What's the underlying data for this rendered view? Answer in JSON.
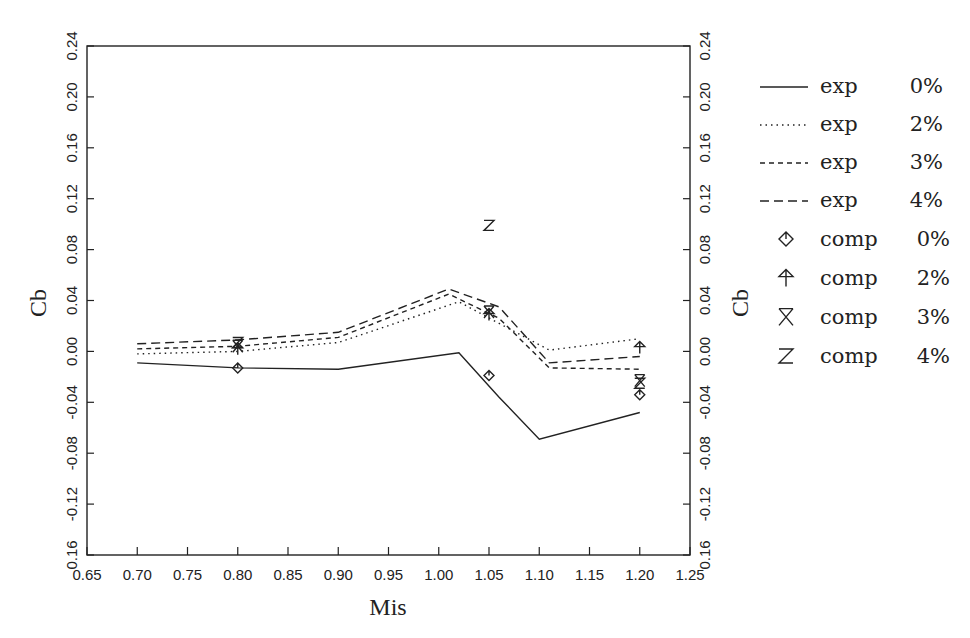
{
  "chart_data": {
    "type": "line",
    "title": "",
    "xlabel": "Mis",
    "ylabel": "Cb",
    "ylabel_right": "Cb",
    "xlim": [
      0.65,
      1.25
    ],
    "ylim": [
      -0.16,
      0.24
    ],
    "grid": false,
    "legend_position": "right-outside",
    "x_ticks": [
      "0.65",
      "0.70",
      "0.75",
      "0.80",
      "0.85",
      "0.90",
      "0.95",
      "1.00",
      "1.05",
      "1.10",
      "1.15",
      "1.20",
      "1.25"
    ],
    "y_ticks": [
      "-0.16",
      "-0.12",
      "-0.08",
      "-0.04",
      "0.00",
      "0.04",
      "0.08",
      "0.12",
      "0.16",
      "0.20",
      "0.24"
    ],
    "y_tick_labels_left": [
      "0.16",
      "-0.12",
      "-0.08",
      "-0.04",
      "0.00",
      "0.04",
      "0.08",
      "0.12",
      "0.16",
      "0.20",
      "0.24"
    ],
    "series": [
      {
        "name": "exp 0%",
        "kind": "line",
        "style": "solid",
        "x": [
          0.7,
          0.8,
          0.9,
          1.02,
          1.06,
          1.1,
          1.2
        ],
        "y": [
          -0.009,
          -0.013,
          -0.014,
          -0.001,
          -0.036,
          -0.069,
          -0.048
        ]
      },
      {
        "name": "exp 2%",
        "kind": "line",
        "style": "dotted",
        "x": [
          0.7,
          0.8,
          0.9,
          1.02,
          1.06,
          1.11,
          1.2
        ],
        "y": [
          -0.002,
          0.0,
          0.007,
          0.039,
          0.022,
          0.001,
          0.01
        ]
      },
      {
        "name": "exp 3%",
        "kind": "line",
        "style": "short-dash",
        "x": [
          0.7,
          0.8,
          0.9,
          1.01,
          1.06,
          1.11,
          1.2
        ],
        "y": [
          0.002,
          0.004,
          0.011,
          0.045,
          0.026,
          -0.013,
          -0.014
        ]
      },
      {
        "name": "exp 4%",
        "kind": "line",
        "style": "long-dash",
        "x": [
          0.7,
          0.8,
          0.9,
          1.01,
          1.06,
          1.11,
          1.2
        ],
        "y": [
          0.006,
          0.009,
          0.015,
          0.049,
          0.035,
          -0.009,
          -0.004
        ]
      },
      {
        "name": "comp 0%",
        "kind": "scatter",
        "marker": "diamond-tick",
        "x": [
          0.8,
          1.05,
          1.2
        ],
        "y": [
          -0.013,
          -0.019,
          -0.034
        ]
      },
      {
        "name": "comp 2%",
        "kind": "scatter",
        "marker": "arrow-up",
        "x": [
          0.8,
          1.05,
          1.2
        ],
        "y": [
          0.002,
          0.029,
          0.003
        ]
      },
      {
        "name": "comp 3%",
        "kind": "scatter",
        "marker": "hourglass",
        "x": [
          0.8,
          1.05,
          1.2
        ],
        "y": [
          0.004,
          0.031,
          -0.023
        ]
      },
      {
        "name": "comp 4%",
        "kind": "scatter",
        "marker": "z",
        "x": [
          0.8,
          1.05,
          1.2
        ],
        "y": [
          0.007,
          0.099,
          -0.025
        ]
      }
    ]
  },
  "legend": {
    "items": [
      {
        "label": "exp",
        "value": "0%"
      },
      {
        "label": "exp",
        "value": "2%"
      },
      {
        "label": "exp",
        "value": "3%"
      },
      {
        "label": "exp",
        "value": "4%"
      },
      {
        "label": "comp",
        "value": "0%"
      },
      {
        "label": "comp",
        "value": "2%"
      },
      {
        "label": "comp",
        "value": "3%"
      },
      {
        "label": "comp",
        "value": "4%"
      }
    ]
  },
  "colors": {
    "ink": "#222222",
    "background": "#ffffff"
  }
}
